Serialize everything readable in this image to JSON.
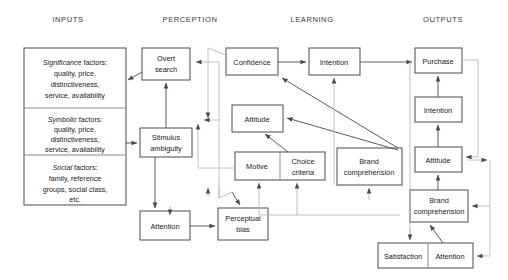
{
  "diagram": {
    "columns": [
      {
        "id": "inputs",
        "label": "INPUTS",
        "x": 68
      },
      {
        "id": "perception",
        "label": "PERCEPTION",
        "x": 190
      },
      {
        "id": "learning",
        "label": "LEARNING",
        "x": 312
      },
      {
        "id": "outputs",
        "label": "OUTPUTS",
        "x": 443
      }
    ],
    "input_groups": [
      {
        "id": "significance",
        "emphasis": "Significance",
        "rest": " factors:",
        "lines": [
          "quality, price,",
          "distinctiveness,",
          "service, availability"
        ]
      },
      {
        "id": "symbolic",
        "emphasis": "Symbolic",
        "rest": " factors:",
        "lines": [
          "quality, price,",
          "distinctiveness,",
          "service, availability"
        ]
      },
      {
        "id": "social",
        "emphasis": "Social",
        "rest": " factors:",
        "lines": [
          "family, reference",
          "groups, social class,",
          "etc."
        ]
      }
    ],
    "nodes": [
      {
        "id": "overt-search",
        "lines": [
          "Overt",
          "search"
        ]
      },
      {
        "id": "stimulus-ambiguity",
        "lines": [
          "Stimulus",
          "ambiguity"
        ]
      },
      {
        "id": "attention-perception",
        "lines": [
          "Attention"
        ]
      },
      {
        "id": "perceptual-bias",
        "lines": [
          "Perceptual",
          "bias"
        ]
      },
      {
        "id": "confidence",
        "lines": [
          "Confidence"
        ]
      },
      {
        "id": "intention-learning",
        "lines": [
          "Intention"
        ]
      },
      {
        "id": "attitude-learning",
        "lines": [
          "Attitude"
        ]
      },
      {
        "id": "motive",
        "lines": [
          "Motive"
        ]
      },
      {
        "id": "choice-criteria",
        "lines": [
          "Choice",
          "criteria"
        ]
      },
      {
        "id": "brand-comprehension-learning",
        "lines": [
          "Brand",
          "comprehension"
        ]
      },
      {
        "id": "purchase",
        "lines": [
          "Purchase"
        ]
      },
      {
        "id": "intention-output",
        "lines": [
          "Intention"
        ]
      },
      {
        "id": "attitude-output",
        "lines": [
          "Attitude"
        ]
      },
      {
        "id": "brand-comprehension-output",
        "lines": [
          "Brand",
          "comprehension"
        ]
      },
      {
        "id": "satisfaction",
        "lines": [
          "Satisfaction"
        ]
      },
      {
        "id": "attention-output",
        "lines": [
          "Attention"
        ]
      }
    ],
    "colors": {
      "box_stroke": "#4a4a4a",
      "arrow": "#4a4a4a",
      "feedback": "#b9b9b9",
      "background": "#ffffff"
    }
  }
}
